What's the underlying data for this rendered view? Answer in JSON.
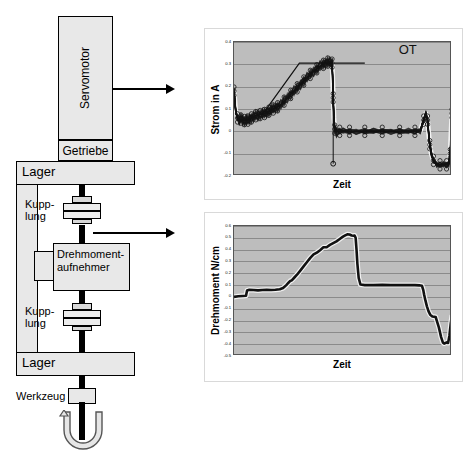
{
  "schematic": {
    "servomotor_label": "Servomotor",
    "getriebe_label": "Getriebe",
    "lager_top_label": "Lager",
    "lager_bottom_label": "Lager",
    "kupplung_1_label": "Kupp-\nlung",
    "kupplung_2_label": "Kupp-\nlung",
    "drehmomentaufnehmer_label": "Drehmoment-\naufnehmer",
    "werkzeug_label": "Werkzeug",
    "callout_1_name": "arrow-to-current-chart",
    "callout_2_name": "arrow-to-torque-chart"
  },
  "chart_data": [
    {
      "id": "current",
      "type": "line",
      "title": "",
      "xlabel": "Zeit",
      "ylabel": "Strom in A",
      "ylim": [
        -0.2,
        0.4
      ],
      "yticks": [
        "0.4",
        "0.3",
        "0.2",
        "0.1",
        "0",
        "-0.1",
        "-0.2"
      ],
      "xticks": [],
      "grid": true,
      "plot_bg": "#bdbdbd",
      "series_color": "#111111",
      "annotations": [
        {
          "text": "OT",
          "x_frac": 0.76,
          "y_value": 0.37
        }
      ],
      "reference_line": {
        "y_value": 0.305,
        "x_start_frac": 0.3,
        "x_end_frac": 0.6
      },
      "marker_drop": {
        "x_frac": 0.455,
        "y_top": 0.18,
        "y_bottom": -0.145
      },
      "x": [
        0.0,
        0.008,
        0.016,
        0.024,
        0.032,
        0.04,
        0.048,
        0.056,
        0.064,
        0.072,
        0.08,
        0.09,
        0.1,
        0.11,
        0.12,
        0.13,
        0.14,
        0.15,
        0.16,
        0.17,
        0.18,
        0.19,
        0.2,
        0.215,
        0.23,
        0.245,
        0.26,
        0.275,
        0.29,
        0.305,
        0.32,
        0.335,
        0.35,
        0.365,
        0.38,
        0.395,
        0.41,
        0.42,
        0.43,
        0.44,
        0.45,
        0.452,
        0.455,
        0.458,
        0.462,
        0.47,
        0.485,
        0.5,
        0.53,
        0.56,
        0.6,
        0.64,
        0.68,
        0.72,
        0.76,
        0.8,
        0.83,
        0.855,
        0.87,
        0.88,
        0.888,
        0.893,
        0.898,
        0.905,
        0.915,
        0.93,
        0.945,
        0.96,
        0.975,
        0.985,
        0.992,
        0.996,
        1.0
      ],
      "y": [
        0.18,
        0.09,
        0.06,
        0.05,
        0.055,
        0.05,
        0.048,
        0.052,
        0.05,
        0.055,
        0.06,
        0.065,
        0.07,
        0.072,
        0.075,
        0.078,
        0.08,
        0.085,
        0.09,
        0.095,
        0.1,
        0.105,
        0.11,
        0.12,
        0.135,
        0.15,
        0.165,
        0.18,
        0.195,
        0.21,
        0.225,
        0.24,
        0.255,
        0.268,
        0.28,
        0.292,
        0.3,
        0.305,
        0.31,
        0.308,
        0.305,
        0.25,
        0.15,
        0.06,
        0.01,
        -0.002,
        0.0,
        0.002,
        0.0,
        -0.001,
        0.0,
        0.001,
        0.0,
        -0.001,
        0.0,
        0.001,
        0.0,
        0.002,
        0.05,
        0.08,
        0.05,
        -0.01,
        -0.06,
        -0.1,
        -0.13,
        -0.148,
        -0.15,
        -0.148,
        -0.15,
        -0.145,
        -0.1,
        0.0,
        0.08
      ]
    },
    {
      "id": "torque",
      "type": "line",
      "title": "",
      "xlabel": "Zeit",
      "ylabel": "Drehmoment N/cm",
      "ylim": [
        -0.5,
        0.6
      ],
      "yticks": [
        "0.6",
        "0.5",
        "0.4",
        "0.3",
        "0.2",
        "0.1",
        "0",
        "-0.1",
        "-0.2",
        "-0.3",
        "-0.4",
        "-0.5"
      ],
      "xticks": [],
      "grid": true,
      "plot_bg": "#bdbdbd",
      "series_color": "#111111",
      "annotations": [],
      "x": [
        0.0,
        0.02,
        0.04,
        0.055,
        0.06,
        0.07,
        0.09,
        0.11,
        0.13,
        0.15,
        0.17,
        0.19,
        0.21,
        0.225,
        0.24,
        0.25,
        0.258,
        0.265,
        0.275,
        0.29,
        0.305,
        0.32,
        0.335,
        0.35,
        0.365,
        0.38,
        0.395,
        0.41,
        0.425,
        0.44,
        0.455,
        0.47,
        0.485,
        0.5,
        0.51,
        0.52,
        0.53,
        0.54,
        0.548,
        0.553,
        0.558,
        0.562,
        0.566,
        0.572,
        0.58,
        0.6,
        0.64,
        0.68,
        0.72,
        0.76,
        0.8,
        0.83,
        0.85,
        0.862,
        0.868,
        0.872,
        0.878,
        0.885,
        0.892,
        0.9,
        0.91,
        0.925,
        0.94,
        0.95,
        0.958,
        0.964,
        0.97,
        0.976,
        0.982,
        0.988,
        0.994,
        1.0
      ],
      "y": [
        0.0,
        0.005,
        0.008,
        0.01,
        0.055,
        0.06,
        0.058,
        0.055,
        0.058,
        0.06,
        0.058,
        0.06,
        0.065,
        0.075,
        0.1,
        0.12,
        0.135,
        0.14,
        0.16,
        0.19,
        0.225,
        0.26,
        0.295,
        0.33,
        0.36,
        0.375,
        0.395,
        0.42,
        0.42,
        0.44,
        0.455,
        0.47,
        0.49,
        0.51,
        0.52,
        0.53,
        0.528,
        0.52,
        0.518,
        0.52,
        0.5,
        0.4,
        0.28,
        0.16,
        0.105,
        0.1,
        0.1,
        0.102,
        0.1,
        0.101,
        0.1,
        0.1,
        0.098,
        0.095,
        0.06,
        0.02,
        -0.03,
        -0.08,
        -0.12,
        -0.15,
        -0.165,
        -0.17,
        -0.26,
        -0.34,
        -0.385,
        -0.395,
        -0.39,
        -0.385,
        -0.39,
        -0.33,
        -0.23,
        -0.155
      ]
    }
  ]
}
